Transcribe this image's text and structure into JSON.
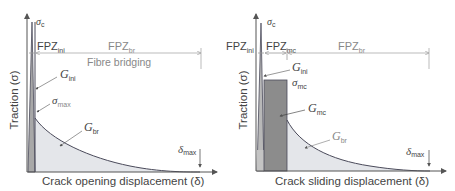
{
  "panels": [
    {
      "id": "mode-i",
      "y_axis_label": "Traction (σ)",
      "x_axis_label": "Crack opening displacement (δ)",
      "peak_label": {
        "symbol": "σ",
        "sub": "c"
      },
      "zones": [
        {
          "label": "FPZ",
          "sub": "ini"
        },
        {
          "label": "FPZ",
          "sub": "br"
        }
      ],
      "zone_caption": "Fibre bridging",
      "energies": [
        {
          "label": "G",
          "sub": "ini"
        },
        {
          "label": "G",
          "sub": "br"
        }
      ],
      "stress_label": {
        "symbol": "σ",
        "sub": "max"
      },
      "delta_max": {
        "symbol": "δ",
        "sub": "max"
      }
    },
    {
      "id": "mode-ii",
      "y_axis_label": "Traction (σ)",
      "x_axis_label": "Crack sliding displacement (δ)",
      "peak_label": {
        "symbol": "σ",
        "sub": "c"
      },
      "zones": [
        {
          "label": "FPZ",
          "sub": "ini"
        },
        {
          "label": "FPZ",
          "sub": "mc"
        },
        {
          "label": "FPZ",
          "sub": "br"
        }
      ],
      "energies": [
        {
          "label": "G",
          "sub": "ini"
        },
        {
          "label": "G",
          "sub": "mc"
        },
        {
          "label": "G",
          "sub": "br"
        }
      ],
      "stress_label": {
        "symbol": "σ",
        "sub": "mc"
      },
      "delta_max": {
        "symbol": "δ",
        "sub": "max"
      }
    }
  ],
  "colors": {
    "axis": "#555555",
    "curve": "#4a4a5a",
    "fill_light": "#e4e6ea",
    "fill_mid": "#a8a8a8",
    "fill_dark": "#8c8c8c",
    "dim_line": "#aaaaaa"
  }
}
